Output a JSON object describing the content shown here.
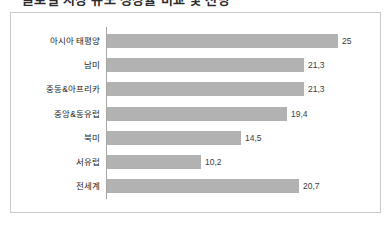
{
  "title_sliver": "글로벌 시장 규모 성장률 비교 및 전망",
  "chart_data": {
    "type": "bar",
    "orientation": "horizontal",
    "title": "",
    "xlabel": "",
    "ylabel": "",
    "grid": false,
    "legend": false,
    "xlim": [
      0,
      27
    ],
    "decimal_separator": ",",
    "bar_color": "#b2b2b2",
    "axis_color": "#a6a6a6",
    "categories": [
      "아시아 태평양",
      "남미",
      "중동&아프리카",
      "중앙&동유럽",
      "북미",
      "서유럽",
      "전세계"
    ],
    "values": [
      25,
      21.3,
      21.3,
      19.4,
      14.5,
      10.2,
      20.7
    ],
    "value_labels": [
      "25",
      "21,3",
      "21,3",
      "19,4",
      "14,5",
      "10,2",
      "20,7"
    ]
  }
}
